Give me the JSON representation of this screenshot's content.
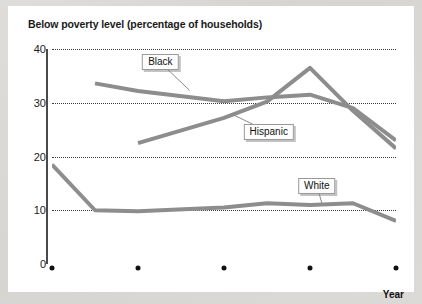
{
  "chart_data": {
    "type": "line",
    "title": "Below poverty level (percentage of households)",
    "xlabel": "Year",
    "ylabel": "",
    "xlim": [
      1961,
      2001
    ],
    "ylim": [
      0,
      40
    ],
    "grid": true,
    "grid_style": "dotted-horizontal",
    "legend": "inline-callouts",
    "xticks": [
      1961,
      1971,
      1981,
      1991,
      2001
    ],
    "xtick_labels": [
      "1961",
      "1971",
      "1981",
      "1991",
      "2001"
    ],
    "yticks": [
      0,
      10,
      20,
      30,
      40
    ],
    "ytick_labels": [
      "0",
      "10",
      "20",
      "30",
      "40"
    ],
    "line_color": "#8d8d8d",
    "series": [
      {
        "name": "Black",
        "label": "Black",
        "x": [
          1966,
          1971,
          1981,
          1986,
          1991,
          1996,
          2001
        ],
        "values": [
          33.6,
          32.2,
          30.3,
          31.0,
          31.5,
          29.0,
          23.0
        ]
      },
      {
        "name": "Hispanic",
        "label": "Hispanic",
        "x": [
          1971,
          1981,
          1986,
          1991,
          1996,
          2001
        ],
        "values": [
          22.5,
          27.2,
          30.2,
          36.5,
          28.5,
          21.5
        ]
      },
      {
        "name": "White",
        "label": "White",
        "x": [
          1961,
          1966,
          1971,
          1981,
          1986,
          1991,
          1996,
          2001
        ],
        "values": [
          18.5,
          10.0,
          9.8,
          10.5,
          11.3,
          11.0,
          11.3,
          8.0
        ]
      }
    ],
    "annotations": [
      {
        "text": "Black",
        "box_x": 1973.6,
        "box_y": 37.5,
        "anchor_x": 1977.0,
        "anchor_y": 32.3
      },
      {
        "text": "Hispanic",
        "box_x": 1986.2,
        "box_y": 24.6,
        "anchor_x": 1982.0,
        "anchor_y": 27.8
      },
      {
        "text": "White",
        "box_x": 1991.8,
        "box_y": 14.6,
        "anchor_x": 1992.4,
        "anchor_y": 11.2
      }
    ]
  }
}
